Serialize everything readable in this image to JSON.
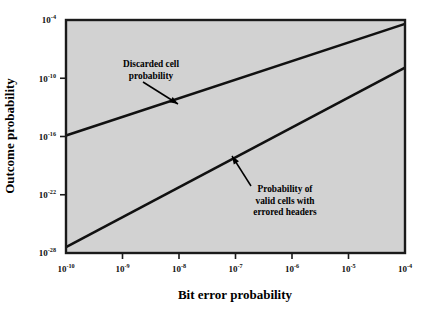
{
  "chart_data": {
    "type": "line",
    "title": "",
    "xlabel": "Bit error probability",
    "ylabel": "Outcome probability",
    "xscale": "log",
    "yscale": "log",
    "xlim": [
      1e-10,
      0.0001
    ],
    "ylim": [
      1e-28,
      0.0001
    ],
    "grid": false,
    "legend_position": "none",
    "plot_background_color": "#d2d2d2",
    "line_color": "#111111",
    "xticks": [
      {
        "value": 1e-10,
        "mantissa": "10",
        "exponent": "-10"
      },
      {
        "value": 1e-09,
        "mantissa": "10",
        "exponent": "-9"
      },
      {
        "value": 1e-08,
        "mantissa": "10",
        "exponent": "-8"
      },
      {
        "value": 1e-07,
        "mantissa": "10",
        "exponent": "-7"
      },
      {
        "value": 1e-06,
        "mantissa": "10",
        "exponent": "-6"
      },
      {
        "value": 1e-05,
        "mantissa": "10",
        "exponent": "-5"
      },
      {
        "value": 0.0001,
        "mantissa": "10",
        "exponent": "-4"
      }
    ],
    "yticks": [
      {
        "value": 0.0001,
        "mantissa": "10",
        "exponent": "-4"
      },
      {
        "value": 1e-10,
        "mantissa": "10",
        "exponent": "-10"
      },
      {
        "value": 1e-16,
        "mantissa": "10",
        "exponent": "-16"
      },
      {
        "value": 1e-22,
        "mantissa": "10",
        "exponent": "-22"
      },
      {
        "value": 1e-28,
        "mantissa": "10",
        "exponent": "-28"
      }
    ],
    "series": [
      {
        "name": "Discarded cell probability",
        "x": [
          1e-10,
          0.0001
        ],
        "y_log10": [
          -15.9,
          -4.4
        ],
        "x_log10": [
          -10,
          -4
        ]
      },
      {
        "name": "Probability of valid cells with errored headers",
        "x": [
          1e-10,
          0.0001
        ],
        "y_log10": [
          -27.4,
          -8.9
        ],
        "x_log10": [
          -10,
          -4
        ]
      }
    ],
    "annotations": [
      {
        "id": "discarded-cell-probability",
        "lines": [
          "Discarded cell",
          "probability"
        ],
        "text": "Discarded cell probability",
        "text_anchor": "middle",
        "text_x": 151,
        "text_y": 67,
        "arrow_from": [
          143,
          82
        ],
        "arrow_to": [
          178,
          104
        ]
      },
      {
        "id": "valid-cells-errored-headers",
        "lines": [
          "Probability of",
          "valid cells with",
          "errored headers"
        ],
        "text": "Probability of valid cells with errored headers",
        "text_anchor": "middle",
        "text_x": 285,
        "text_y": 192,
        "arrow_from": [
          251,
          186
        ],
        "arrow_to": [
          232,
          156
        ]
      }
    ]
  },
  "axis_titles": {
    "x": "Bit error probability",
    "y": "Outcome probability"
  }
}
